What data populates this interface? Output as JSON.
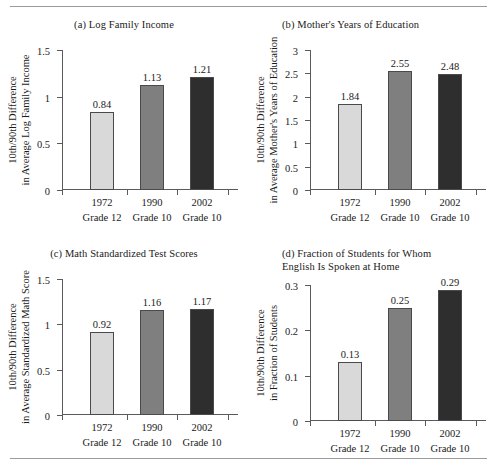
{
  "figure": {
    "rule_top": "horizontal-rule",
    "rule_bottom": "horizontal-rule"
  },
  "chart_data": [
    {
      "id": "a",
      "type": "bar",
      "title": "(a)  Log Family Income",
      "title_align": "center",
      "ylabel_line1": "10th/90th Difference",
      "ylabel_line2": "in Average Log Family Income",
      "xlabel": "",
      "categories": [
        "1972",
        "1990",
        "2002"
      ],
      "category_sublabels": [
        "Grade 12",
        "Grade 10",
        "Grade 10"
      ],
      "values": [
        0.84,
        1.13,
        1.21
      ],
      "value_labels": [
        "0.84",
        "1.13",
        "1.21"
      ],
      "ylim": [
        0,
        1.5
      ],
      "yticks": [
        0,
        0.5,
        1,
        1.5
      ],
      "ytick_labels": [
        "0",
        "0.5",
        "1",
        "1.5"
      ],
      "grid": false,
      "legend": "none",
      "bar_colors": [
        "#d9d9d9",
        "#7f7f7f",
        "#2e2e2e"
      ]
    },
    {
      "id": "b",
      "type": "bar",
      "title": "(b)  Mother's Years of Education",
      "title_align": "left",
      "ylabel_line1": "10th/90th Difference",
      "ylabel_line2": "in Average Mother's Years of Education",
      "xlabel": "",
      "categories": [
        "1972",
        "1990",
        "2002"
      ],
      "category_sublabels": [
        "Grade 12",
        "Grade 10",
        "Grade 10"
      ],
      "values": [
        1.84,
        2.55,
        2.48
      ],
      "value_labels": [
        "1.84",
        "2.55",
        "2.48"
      ],
      "ylim": [
        0,
        3
      ],
      "yticks": [
        0,
        0.5,
        1,
        1.5,
        2,
        2.5,
        3
      ],
      "ytick_labels": [
        "0",
        "0.5",
        "1",
        "1.5",
        "2",
        "2.5",
        "3"
      ],
      "grid": false,
      "legend": "none",
      "bar_colors": [
        "#d9d9d9",
        "#7f7f7f",
        "#2e2e2e"
      ]
    },
    {
      "id": "c",
      "type": "bar",
      "title": "(c)  Math Standardized Test Scores",
      "title_align": "center",
      "ylabel_line1": "10th/90th Difference",
      "ylabel_line2": "in Average Standardized Math Score",
      "xlabel": "",
      "categories": [
        "1972",
        "1990",
        "2002"
      ],
      "category_sublabels": [
        "Grade 12",
        "Grade 10",
        "Grade 10"
      ],
      "values": [
        0.92,
        1.16,
        1.17
      ],
      "value_labels": [
        "0.92",
        "1.16",
        "1.17"
      ],
      "ylim": [
        0,
        1.5
      ],
      "yticks": [
        0,
        0.5,
        1,
        1.5
      ],
      "ytick_labels": [
        "0",
        "0.5",
        "1",
        "1.5"
      ],
      "grid": false,
      "legend": "none",
      "bar_colors": [
        "#d9d9d9",
        "#7f7f7f",
        "#2e2e2e"
      ]
    },
    {
      "id": "d",
      "type": "bar",
      "title": "(d) Fraction of Students for Whom\nEnglish Is Spoken at Home",
      "title_align": "left",
      "ylabel_line1": "10th/90th Difference",
      "ylabel_line2": "in Fraction of Students",
      "xlabel": "",
      "categories": [
        "1972",
        "1990",
        "2002"
      ],
      "category_sublabels": [
        "Grade 12",
        "Grade 10",
        "Grade 10"
      ],
      "values": [
        0.13,
        0.25,
        0.29
      ],
      "value_labels": [
        "0.13",
        "0.25",
        "0.29"
      ],
      "ylim": [
        0,
        0.3
      ],
      "yticks": [
        0,
        0.1,
        0.2,
        0.3
      ],
      "ytick_labels": [
        "0",
        "0.1",
        "0.2",
        "0.3"
      ],
      "grid": false,
      "legend": "none",
      "bar_colors": [
        "#d9d9d9",
        "#7f7f7f",
        "#2e2e2e"
      ]
    }
  ]
}
